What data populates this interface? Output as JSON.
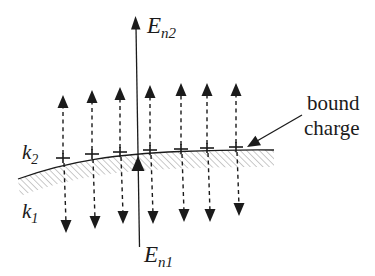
{
  "figure": {
    "kind": "dielectric-interface-field-diagram",
    "regions": {
      "above": {
        "base": "k",
        "sub": "2"
      },
      "below": {
        "base": "k",
        "sub": "1"
      }
    },
    "normal_field_above": {
      "base": "E",
      "sub": "n2"
    },
    "normal_field_below": {
      "base": "E",
      "sub": "n1"
    },
    "annotation": {
      "line1": "bound",
      "line2": "charge"
    }
  },
  "colors": {
    "ink": "#1b1b1b",
    "hatch": "#b3b3b3",
    "background": "#ffffff"
  },
  "diagram": {
    "field_lines": [
      {
        "x": 63,
        "plus_y": 158,
        "top_tip_y": 95,
        "bottom_tip_y": 233
      },
      {
        "x": 92,
        "plus_y": 154,
        "top_tip_y": 90,
        "bottom_tip_y": 229
      },
      {
        "x": 120,
        "plus_y": 152,
        "top_tip_y": 87,
        "bottom_tip_y": 224
      },
      {
        "x": 150,
        "plus_y": 150,
        "top_tip_y": 85,
        "bottom_tip_y": 224
      },
      {
        "x": 181,
        "plus_y": 149,
        "top_tip_y": 83,
        "bottom_tip_y": 222
      },
      {
        "x": 207,
        "plus_y": 148,
        "top_tip_y": 83,
        "bottom_tip_y": 222
      },
      {
        "x": 236,
        "plus_y": 147,
        "top_tip_y": 83,
        "bottom_tip_y": 216
      }
    ],
    "central_axis": {
      "x_top": 136,
      "y_top_tip": 16,
      "y_mid_tip": 156,
      "x_bottom": 139.5,
      "y_bottom": 247
    },
    "interface": {
      "x_left": 18,
      "y_left": 179,
      "x_right": 274,
      "y_right": 150,
      "band_thickness": 16
    }
  }
}
